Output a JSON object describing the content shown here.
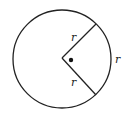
{
  "diagram": {
    "type": "circle-with-sector",
    "circle": {
      "cx": 62,
      "cy": 59,
      "r": 49,
      "stroke": "#222222"
    },
    "center": {
      "x": 62,
      "y": 58
    },
    "radii": [
      {
        "x2": 96,
        "y2": 24,
        "label": "r",
        "label_x": 71,
        "label_y": 41
      },
      {
        "x2": 96,
        "y2": 95,
        "label": "r",
        "label_x": 71,
        "label_y": 86
      }
    ],
    "arc_label": {
      "text": "r",
      "x": 115,
      "y": 63
    },
    "center_dot": {
      "x": 71,
      "y": 60,
      "r": 2.2
    }
  }
}
